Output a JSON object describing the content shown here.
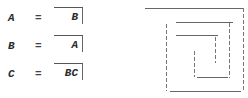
{
  "equations": [
    {
      "variable": "A",
      "equals": "=",
      "value": "B"
    },
    {
      "variable": "B",
      "equals": "=",
      "value": "A"
    },
    {
      "variable": "C",
      "equals": "=",
      "value": "BC"
    }
  ],
  "diagram": {
    "type": "rectangular-spiral",
    "line_color": "#666666"
  }
}
